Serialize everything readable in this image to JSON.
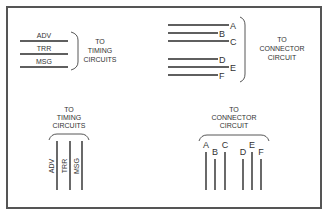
{
  "diagram": {
    "panels": [
      {
        "id": "timing-horizontal",
        "orientation": "horizontal",
        "signals": [
          "ADV",
          "TRR",
          "MSG"
        ],
        "destination": [
          "TO",
          "TIMING",
          "CIRCUITS"
        ]
      },
      {
        "id": "connector-horizontal",
        "orientation": "horizontal",
        "signals": [
          "A",
          "B",
          "C",
          "D",
          "E",
          "F"
        ],
        "destination": [
          "TO",
          "CONNECTOR",
          "CIRCUIT"
        ]
      },
      {
        "id": "timing-vertical",
        "orientation": "vertical",
        "signals": [
          "ADV",
          "TRR",
          "MSG"
        ],
        "destination": [
          "TO",
          "TIMING",
          "CIRCUITS"
        ]
      },
      {
        "id": "connector-vertical",
        "orientation": "vertical",
        "signals": [
          "A",
          "B",
          "C",
          "D",
          "E",
          "F"
        ],
        "destination": [
          "TO",
          "CONNECTOR",
          "CIRCUIT"
        ]
      }
    ]
  }
}
